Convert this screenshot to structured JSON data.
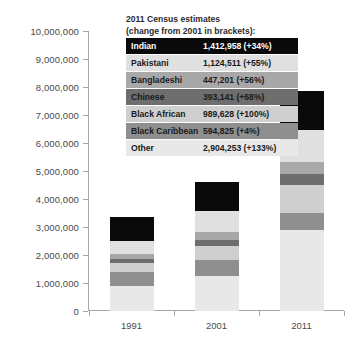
{
  "chart_data": {
    "type": "bar",
    "subtype": "stacked",
    "title": "",
    "legend_title": [
      "2011 Census estimates",
      "(change from  2001 in brackets):"
    ],
    "xlabel": "",
    "ylabel": "",
    "categories": [
      "1991",
      "2001",
      "2011"
    ],
    "ylim": [
      0,
      10000000
    ],
    "ytick_labels": [
      "10,000,000",
      "9,000,000",
      "8,000,000",
      "7,000,000",
      "6,000,000",
      "5,000,000",
      "4,000,000",
      "3,000,000",
      "2,000,000",
      "1,000,000",
      "0"
    ],
    "ytick_values": [
      10000000,
      9000000,
      8000000,
      7000000,
      6000000,
      5000000,
      4000000,
      3000000,
      2000000,
      1000000,
      0
    ],
    "grid": false,
    "legend_position": "inside-top-center",
    "series": [
      {
        "name": "Other",
        "label": "Other",
        "value_2011": "2,904,253 (+133%)",
        "color": "#e8e8e8",
        "text_color": "#1a1a1a",
        "values": [
          900000,
          1245000,
          2904253
        ]
      },
      {
        "name": "Black Caribbean",
        "label": "Black Caribbean",
        "value_2011": "594,825 (+4%)",
        "color": "#8f8f8f",
        "text_color": "#1a1a1a",
        "values": [
          500000,
          572000,
          594825
        ]
      },
      {
        "name": "Black African",
        "label": "Black African",
        "value_2011": "989,628 (+100%)",
        "color": "#cfcfcf",
        "text_color": "#1a1a1a",
        "values": [
          300000,
          495000,
          989628
        ]
      },
      {
        "name": "Chinese",
        "label": "Chinese",
        "value_2011": "393,141 (+68%)",
        "color": "#6e6e6e",
        "text_color": "#1a1a1a",
        "values": [
          160000,
          234000,
          393141
        ]
      },
      {
        "name": "Bangladeshi",
        "label": "Bangladeshi",
        "value_2011": "447,201 (+56%)",
        "color": "#a8a8a8",
        "text_color": "#1a1a1a",
        "values": [
          165000,
          287000,
          447201
        ]
      },
      {
        "name": "Pakistani",
        "label": "Pakistani",
        "value_2011": "1,124,511 (+55%)",
        "color": "#e0e0e0",
        "text_color": "#1a1a1a",
        "values": [
          480000,
          725000,
          1124511
        ]
      },
      {
        "name": "Indian",
        "label": "Indian",
        "value_2011": "1,412,958 (+34%)",
        "color": "#0a0a0a",
        "text_color": "#ffffff",
        "values": [
          840000,
          1053000,
          1412958
        ]
      }
    ],
    "totals": [
      3345000,
      4611000,
      7866517
    ]
  },
  "colors": {
    "axis": "#a6a6a6",
    "tick_text": "#4a4a4a",
    "background": "#ffffff"
  }
}
